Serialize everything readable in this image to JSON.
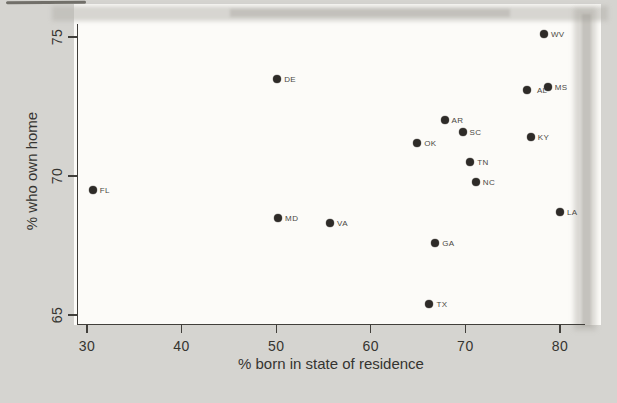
{
  "figure": {
    "background": "#d5d4d0",
    "panel_color": "#fcfbf8",
    "dot_color": "#2e2b28",
    "axis_color": "#413f3b",
    "tick_text_color": "#353430",
    "point_label_color": "#4a4843"
  },
  "chart_data": {
    "type": "scatter",
    "title": "",
    "xlabel": "% born in state of residence",
    "ylabel": "% who own home",
    "xlim": [
      28,
      83
    ],
    "ylim": [
      64.4,
      75.6
    ],
    "x_ticks": [
      30,
      40,
      50,
      60,
      70,
      80
    ],
    "y_ticks": [
      65,
      70,
      75
    ],
    "grid": false,
    "legend": false,
    "points": [
      {
        "label": "FL",
        "x": 30.6,
        "y": 69.5
      },
      {
        "label": "DE",
        "x": 50.1,
        "y": 73.5
      },
      {
        "label": "MD",
        "x": 50.2,
        "y": 68.5
      },
      {
        "label": "VA",
        "x": 55.7,
        "y": 68.3
      },
      {
        "label": "OK",
        "x": 64.9,
        "y": 71.2
      },
      {
        "label": "TX",
        "x": 66.2,
        "y": 65.4
      },
      {
        "label": "GA",
        "x": 66.8,
        "y": 67.6
      },
      {
        "label": "AR",
        "x": 67.8,
        "y": 72.0
      },
      {
        "label": "SC",
        "x": 69.7,
        "y": 71.6
      },
      {
        "label": "TN",
        "x": 70.5,
        "y": 70.5
      },
      {
        "label": "NC",
        "x": 71.1,
        "y": 69.8
      },
      {
        "label": "AL",
        "x": 76.5,
        "y": 73.1
      },
      {
        "label": "KY",
        "x": 76.9,
        "y": 71.4
      },
      {
        "label": "WV",
        "x": 78.3,
        "y": 75.1
      },
      {
        "label": "MS",
        "x": 78.7,
        "y": 73.2
      },
      {
        "label": "LA",
        "x": 80.0,
        "y": 68.7
      }
    ]
  }
}
